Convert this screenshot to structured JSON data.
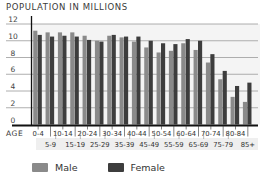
{
  "chart_data": {
    "type": "bar",
    "title": "POPULATION IN MILLIONS",
    "xlabel": "AGE",
    "ylabel": "",
    "ylim": [
      0,
      12
    ],
    "yticks": [
      0,
      2,
      4,
      6,
      8,
      10,
      12
    ],
    "grid": true,
    "legend_position": "bottom",
    "categories": [
      "0-4",
      "5-9",
      "10-14",
      "15-19",
      "20-24",
      "25-29",
      "30-34",
      "35-39",
      "40-44",
      "45-49",
      "50-54",
      "55-59",
      "60-64",
      "65-69",
      "70-74",
      "75-79",
      "80-84",
      "85+"
    ],
    "series": [
      {
        "name": "Male",
        "color": "#8a8a8a",
        "values": [
          11.2,
          11.0,
          11.0,
          11.0,
          10.6,
          10.0,
          10.6,
          10.4,
          9.9,
          9.2,
          8.6,
          8.8,
          9.7,
          8.9,
          7.4,
          5.4,
          3.3,
          2.7
        ]
      },
      {
        "name": "Female",
        "color": "#3d3d3d",
        "values": [
          10.7,
          10.5,
          10.6,
          10.5,
          10.1,
          9.9,
          10.7,
          10.5,
          10.5,
          10.0,
          9.7,
          9.6,
          10.2,
          10.0,
          8.4,
          6.4,
          4.6,
          5.0
        ]
      }
    ]
  },
  "legend": {
    "male_label": "Male",
    "female_label": "Female",
    "male_color": "#8a8a8a",
    "female_color": "#3d3d3d"
  }
}
